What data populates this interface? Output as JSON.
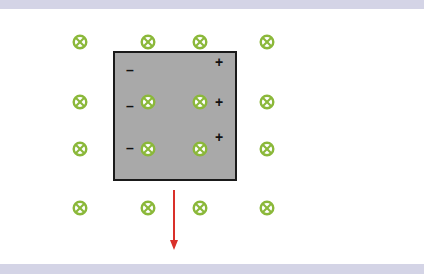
{
  "diagram": {
    "colors": {
      "field_symbol": "#8bb83a",
      "plate_fill": "#a9a9a9",
      "plate_border": "#1a1a1a",
      "velocity_arrow": "#d9302a",
      "band": "#d4d4e6"
    },
    "field_symbol": "circle-x-icon (field into page)",
    "field_points": [
      {
        "x": 80,
        "y": 42
      },
      {
        "x": 148,
        "y": 42
      },
      {
        "x": 200,
        "y": 42
      },
      {
        "x": 267,
        "y": 42
      },
      {
        "x": 80,
        "y": 102
      },
      {
        "x": 148,
        "y": 102
      },
      {
        "x": 200,
        "y": 102
      },
      {
        "x": 267,
        "y": 102
      },
      {
        "x": 80,
        "y": 149
      },
      {
        "x": 148,
        "y": 149
      },
      {
        "x": 200,
        "y": 149
      },
      {
        "x": 267,
        "y": 149
      },
      {
        "x": 80,
        "y": 208
      },
      {
        "x": 148,
        "y": 208
      },
      {
        "x": 200,
        "y": 208
      },
      {
        "x": 267,
        "y": 208
      }
    ],
    "charges": [
      {
        "sign": "–",
        "x": 126,
        "y": 63
      },
      {
        "sign": "–",
        "x": 126,
        "y": 99
      },
      {
        "sign": "–",
        "x": 126,
        "y": 141
      },
      {
        "sign": "+",
        "x": 215,
        "y": 55
      },
      {
        "sign": "+",
        "x": 215,
        "y": 95
      },
      {
        "sign": "+",
        "x": 215,
        "y": 130
      }
    ],
    "velocity_arrow": {
      "direction": "down",
      "x": 174,
      "y1": 190,
      "y2": 250
    }
  }
}
